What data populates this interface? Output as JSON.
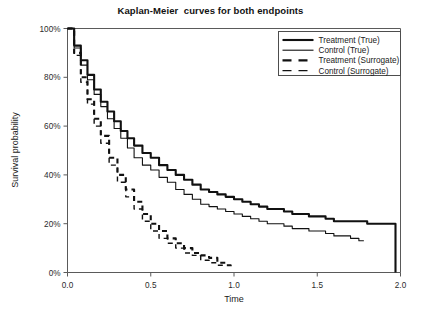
{
  "chart_data": {
    "type": "line",
    "title": "Kaplan-Meier  curves for both endpoints",
    "xlabel": "Time",
    "ylabel": "Survival probability",
    "xlim": [
      0.0,
      2.0
    ],
    "ylim": [
      0,
      100
    ],
    "grid": false,
    "legend_position": "top-right",
    "xticks": [
      "0.0",
      "0.5",
      "1.0",
      "1.5",
      "2.0"
    ],
    "xtick_values": [
      0.0,
      0.5,
      1.0,
      1.5,
      2.0
    ],
    "yticks": [
      "0%",
      "20%",
      "40%",
      "60%",
      "80%",
      "100%"
    ],
    "ytick_values": [
      0,
      20,
      40,
      60,
      80,
      100
    ],
    "series": [
      {
        "name": "Treatment (True)",
        "style": "solid",
        "width": "thick",
        "color": "#111111",
        "x": [
          0.0,
          0.04,
          0.08,
          0.12,
          0.16,
          0.2,
          0.24,
          0.28,
          0.32,
          0.36,
          0.4,
          0.45,
          0.5,
          0.55,
          0.6,
          0.65,
          0.7,
          0.75,
          0.8,
          0.85,
          0.9,
          0.95,
          1.0,
          1.05,
          1.1,
          1.15,
          1.2,
          1.25,
          1.3,
          1.35,
          1.4,
          1.45,
          1.5,
          1.55,
          1.6,
          1.7,
          1.8,
          1.9,
          1.95,
          1.97
        ],
        "y": [
          100,
          93,
          87,
          81,
          75,
          70,
          66,
          62,
          58,
          55,
          52,
          49,
          47,
          44,
          42,
          40,
          38,
          36,
          34,
          33,
          32,
          31,
          30,
          29,
          28,
          27,
          26,
          26,
          25,
          24,
          24,
          23,
          23,
          22,
          21,
          21,
          20,
          20,
          20,
          0
        ]
      },
      {
        "name": "Control (True)",
        "style": "solid",
        "width": "thin",
        "color": "#111111",
        "x": [
          0.0,
          0.04,
          0.08,
          0.12,
          0.16,
          0.2,
          0.24,
          0.28,
          0.32,
          0.36,
          0.4,
          0.45,
          0.5,
          0.55,
          0.6,
          0.65,
          0.7,
          0.75,
          0.8,
          0.85,
          0.9,
          0.95,
          1.0,
          1.05,
          1.1,
          1.15,
          1.2,
          1.25,
          1.3,
          1.35,
          1.4,
          1.45,
          1.5,
          1.55,
          1.6,
          1.65,
          1.7,
          1.75,
          1.78
        ],
        "y": [
          100,
          92,
          85,
          79,
          73,
          68,
          63,
          59,
          55,
          51,
          47,
          44,
          42,
          39,
          37,
          34,
          32,
          30,
          28,
          27,
          26,
          25,
          24,
          23,
          22,
          21,
          20,
          20,
          19,
          18,
          18,
          17,
          17,
          16,
          15,
          15,
          14,
          13,
          13
        ]
      },
      {
        "name": "Treatment (Surrogate)",
        "style": "dashed",
        "width": "thick",
        "color": "#111111",
        "x": [
          0.0,
          0.04,
          0.08,
          0.12,
          0.16,
          0.2,
          0.25,
          0.3,
          0.35,
          0.4,
          0.45,
          0.5,
          0.55,
          0.6,
          0.65,
          0.7,
          0.75,
          0.8,
          0.85,
          0.9,
          0.95,
          0.98
        ],
        "y": [
          100,
          90,
          80,
          71,
          63,
          56,
          47,
          40,
          34,
          29,
          24,
          20,
          17,
          14,
          12,
          10,
          8,
          7,
          6,
          4,
          3,
          2
        ]
      },
      {
        "name": "Control (Surrogate)",
        "style": "dashed",
        "width": "thin",
        "color": "#111111",
        "x": [
          0.0,
          0.04,
          0.08,
          0.12,
          0.16,
          0.2,
          0.25,
          0.3,
          0.35,
          0.4,
          0.45,
          0.5,
          0.55,
          0.6,
          0.65,
          0.7,
          0.75,
          0.8,
          0.85,
          0.9,
          0.93
        ],
        "y": [
          100,
          89,
          78,
          69,
          60,
          53,
          44,
          37,
          31,
          26,
          21,
          17,
          14,
          12,
          10,
          8,
          7,
          5,
          4,
          3,
          2
        ]
      }
    ]
  },
  "legend": {
    "items": [
      {
        "label": "Treatment (True)"
      },
      {
        "label": "Control (True)"
      },
      {
        "label": "Treatment (Surrogate)"
      },
      {
        "label": "Control (Surrogate)"
      }
    ]
  }
}
